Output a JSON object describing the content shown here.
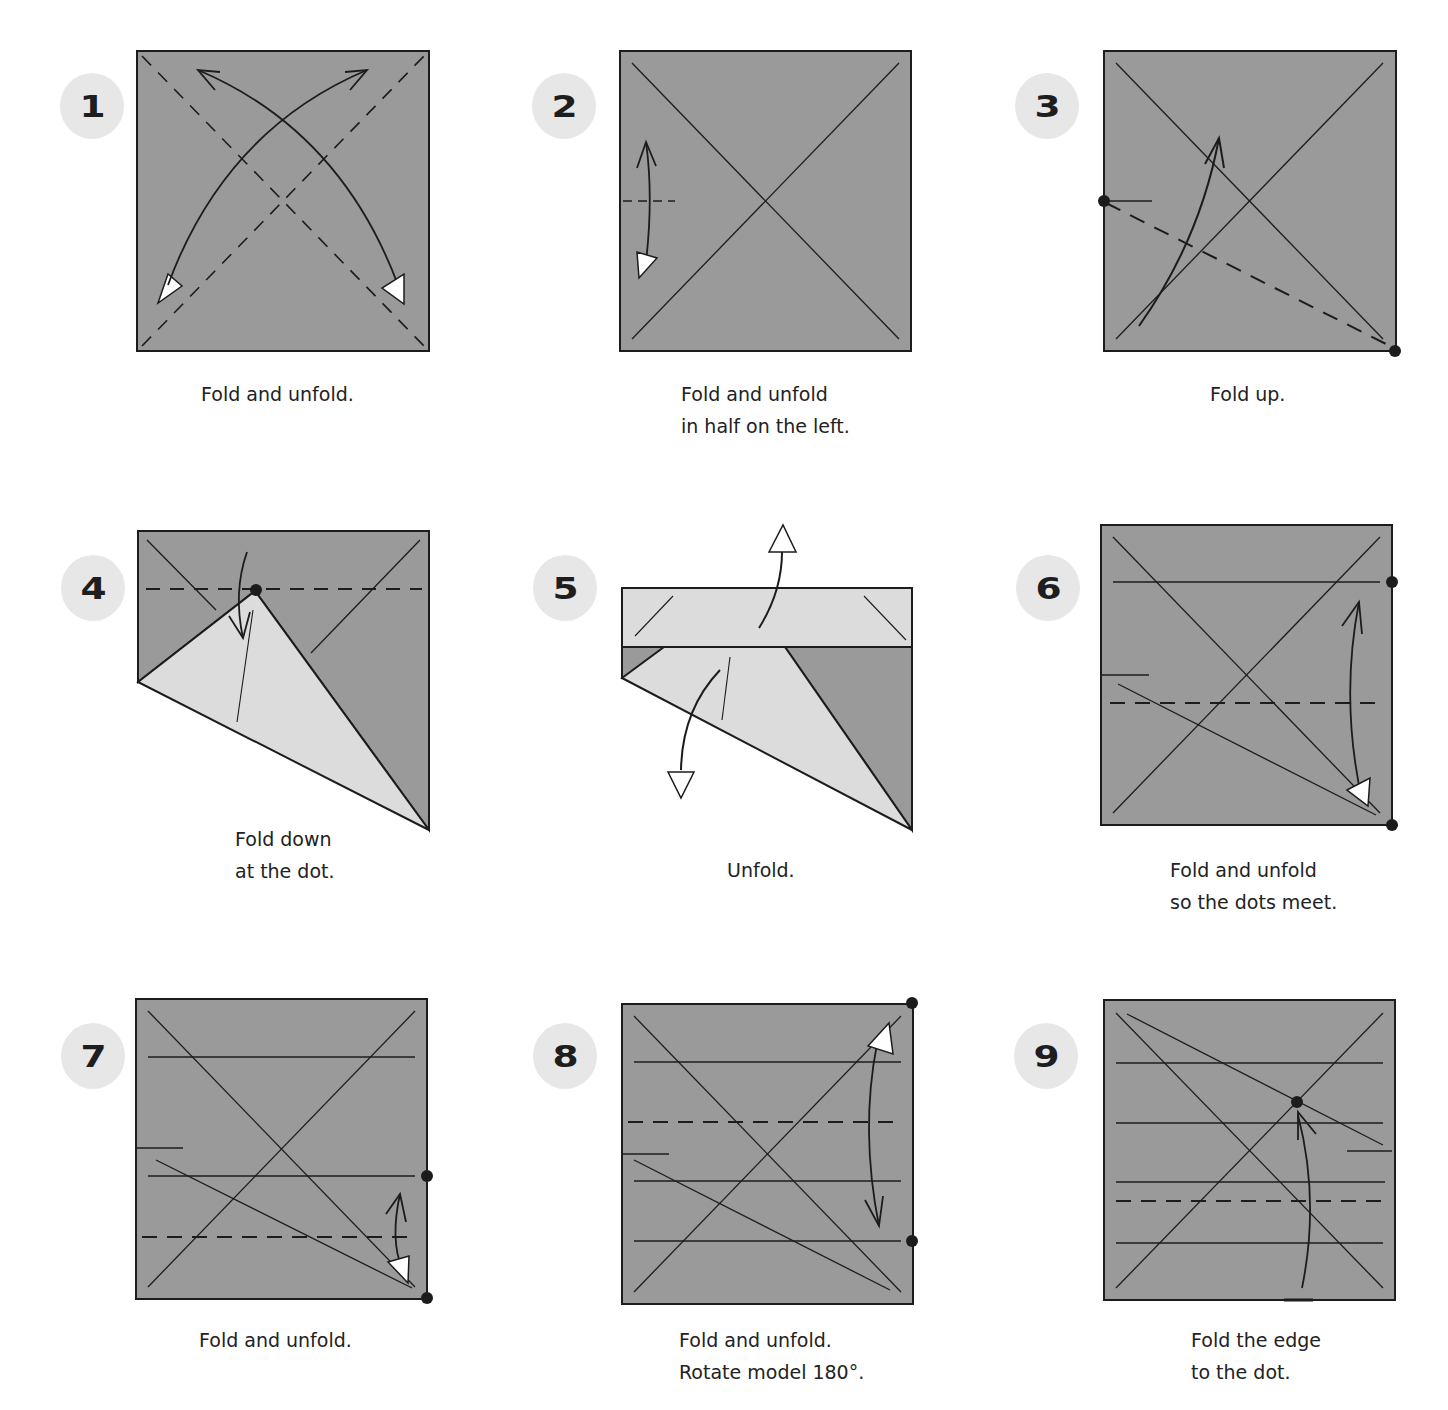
{
  "colors": {
    "paper": "#9a9a9a",
    "flap": "#dcdcdc",
    "line": "#1c1c1c",
    "badge": "#e7e7e7"
  },
  "steps": [
    {
      "number": "1",
      "caption": [
        "Fold and unfold."
      ]
    },
    {
      "number": "2",
      "caption": [
        "Fold and unfold",
        "in half on the left."
      ]
    },
    {
      "number": "3",
      "caption": [
        "Fold up."
      ]
    },
    {
      "number": "4",
      "caption": [
        "Fold down",
        "at the dot."
      ]
    },
    {
      "number": "5",
      "caption": [
        "Unfold."
      ]
    },
    {
      "number": "6",
      "caption": [
        "Fold and unfold",
        "so the dots meet."
      ]
    },
    {
      "number": "7",
      "caption": [
        "Fold and unfold."
      ]
    },
    {
      "number": "8",
      "caption": [
        "Fold and unfold.",
        "Rotate model 180°."
      ]
    },
    {
      "number": "9",
      "caption": [
        "Fold the edge",
        "to the dot."
      ]
    }
  ]
}
